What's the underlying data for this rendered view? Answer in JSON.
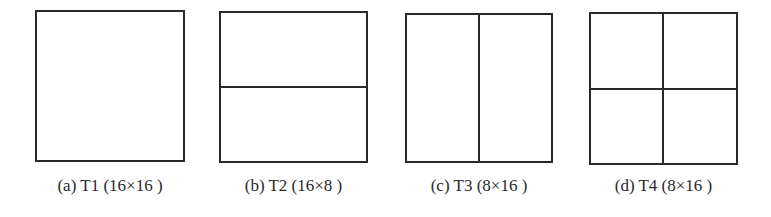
{
  "figure": {
    "panels": [
      {
        "id": "a",
        "caption": "(a) T1 (16×16 )",
        "name": "T1",
        "size": "16×16",
        "splits": "none"
      },
      {
        "id": "b",
        "caption": "(b) T2 (16×8 )",
        "name": "T2",
        "size": "16×8",
        "splits": "horizontal"
      },
      {
        "id": "c",
        "caption": "(c) T3 (8×16 )",
        "name": "T3",
        "size": "8×16",
        "splits": "vertical"
      },
      {
        "id": "d",
        "caption": "(d) T4 (8×16 )",
        "name": "T4",
        "size": "8×16",
        "splits": "quad"
      }
    ],
    "line_color": "#2a2a2a",
    "background": "#ffffff"
  }
}
